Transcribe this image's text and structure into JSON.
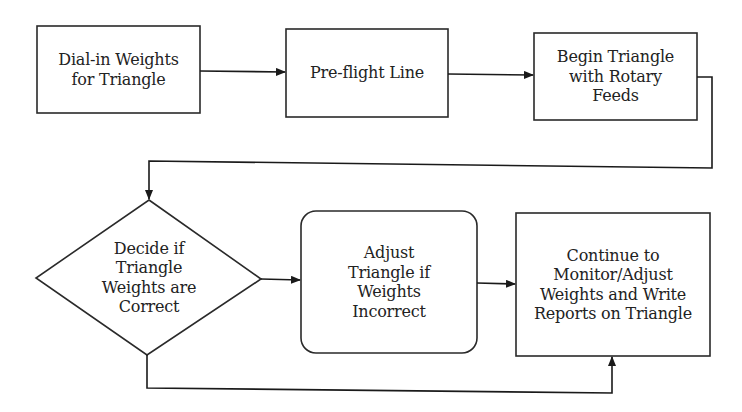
{
  "diagram": {
    "type": "flowchart",
    "colors": {
      "stroke": "#2a2a2a",
      "fill": "#ffffff",
      "text": "#222222"
    },
    "nodes": [
      {
        "id": "dial_in",
        "shape": "rectangle",
        "label": "Dial-in Weights\nfor Triangle"
      },
      {
        "id": "preflight",
        "shape": "rectangle",
        "label": "Pre-flight Line"
      },
      {
        "id": "begin",
        "shape": "rectangle",
        "label": "Begin Triangle\nwith Rotary\nFeeds"
      },
      {
        "id": "decide",
        "shape": "diamond",
        "label": "Decide if\nTriangle\nWeights are\nCorrect"
      },
      {
        "id": "adjust",
        "shape": "rounded-rectangle",
        "label": "Adjust\nTriangle if\nWeights\nIncorrect"
      },
      {
        "id": "continue",
        "shape": "rectangle",
        "label": "Continue to\nMonitor/Adjust\nWeights and Write\nReports on Triangle"
      }
    ],
    "edges": [
      {
        "from": "dial_in",
        "to": "preflight"
      },
      {
        "from": "preflight",
        "to": "begin"
      },
      {
        "from": "begin",
        "to": "decide"
      },
      {
        "from": "decide",
        "to": "adjust"
      },
      {
        "from": "adjust",
        "to": "continue"
      },
      {
        "from": "decide",
        "to": "continue"
      }
    ]
  }
}
